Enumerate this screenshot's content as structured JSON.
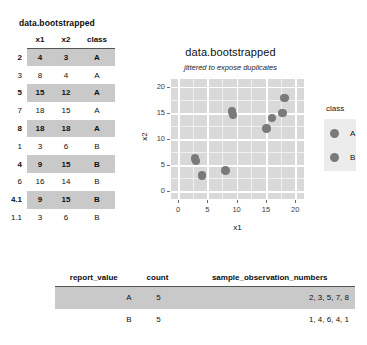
{
  "top_table": {
    "caption": "data.bootstrapped",
    "columns": [
      "",
      "x1",
      "x2",
      "class"
    ],
    "rows": [
      {
        "rowname": "2",
        "x1": "4",
        "x2": "3",
        "class": "A",
        "shaded": true
      },
      {
        "rowname": "3",
        "x1": "8",
        "x2": "4",
        "class": "A",
        "shaded": false
      },
      {
        "rowname": "5",
        "x1": "15",
        "x2": "12",
        "class": "A",
        "shaded": true
      },
      {
        "rowname": "7",
        "x1": "18",
        "x2": "15",
        "class": "A",
        "shaded": false
      },
      {
        "rowname": "8",
        "x1": "18",
        "x2": "18",
        "class": "A",
        "shaded": true
      },
      {
        "rowname": "1",
        "x1": "3",
        "x2": "6",
        "class": "B",
        "shaded": false
      },
      {
        "rowname": "4",
        "x1": "9",
        "x2": "15",
        "class": "B",
        "shaded": true
      },
      {
        "rowname": "6",
        "x1": "16",
        "x2": "14",
        "class": "B",
        "shaded": false
      },
      {
        "rowname": "4.1",
        "x1": "9",
        "x2": "15",
        "class": "B",
        "shaded": true
      },
      {
        "rowname": "1.1",
        "x1": "3",
        "x2": "6",
        "class": "B",
        "shaded": false
      }
    ]
  },
  "bottom_table": {
    "columns": [
      "report_value",
      "count",
      "sample_observation_numbers"
    ],
    "rows": [
      {
        "report_value": "A",
        "count": "5",
        "sample_observation_numbers": "2, 3, 5, 7, 8",
        "shaded": true
      },
      {
        "report_value": "B",
        "count": "5",
        "sample_observation_numbers": "1, 4, 6, 4, 1",
        "shaded": false
      }
    ]
  },
  "chart_data": {
    "type": "scatter",
    "title": "data.bootstrapped",
    "subtitle": "jittered to expose duplicates",
    "xlabel": "x1",
    "ylabel": "x2",
    "xlim": [
      -1.2,
      21.5
    ],
    "ylim": [
      -1.5,
      21.5
    ],
    "xticks": [
      "0",
      "5",
      "10",
      "15",
      "20"
    ],
    "xtick_values": [
      0,
      5,
      10,
      15,
      20
    ],
    "yticks": [
      "0",
      "5",
      "10",
      "15",
      "20"
    ],
    "ytick_values": [
      0,
      5,
      10,
      15,
      20
    ],
    "grid": true,
    "legend": {
      "title": "class",
      "position": "right",
      "entries": [
        {
          "label": "A",
          "color": "#7a7a7a"
        },
        {
          "label": "B",
          "color": "#7a7a7a"
        }
      ]
    },
    "point_color": "#7a7a7a",
    "panel_color": "#d9d9d9",
    "series": [
      {
        "name": "A",
        "points": [
          {
            "x": 4.1,
            "y": 3.0
          },
          {
            "x": 8.1,
            "y": 4.0
          },
          {
            "x": 15.1,
            "y": 12.0
          },
          {
            "x": 17.8,
            "y": 15.0
          },
          {
            "x": 18.2,
            "y": 17.9
          }
        ]
      },
      {
        "name": "B",
        "points": [
          {
            "x": 2.9,
            "y": 6.3
          },
          {
            "x": 3.1,
            "y": 5.8
          },
          {
            "x": 9.2,
            "y": 15.3
          },
          {
            "x": 9.4,
            "y": 14.6
          },
          {
            "x": 16.0,
            "y": 14.0
          }
        ]
      }
    ]
  }
}
